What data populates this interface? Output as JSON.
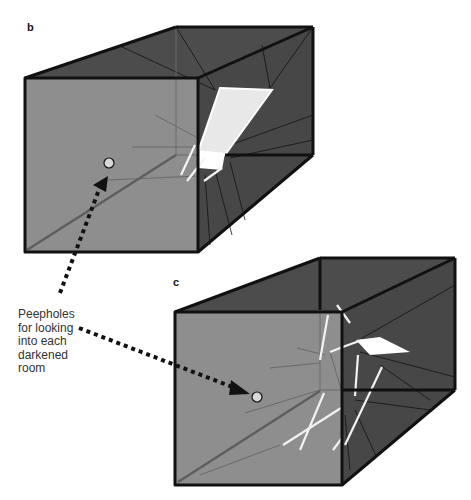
{
  "panels": {
    "b": {
      "label": "b"
    },
    "c": {
      "label": "c"
    }
  },
  "caption": {
    "lines": [
      "Peepholes",
      "for looking",
      "into each",
      "darkened",
      "room"
    ]
  },
  "colors": {
    "front_face": "#8a8a8a",
    "interior_dark": "#4a4a4a",
    "edge": "#111111",
    "highlight": "#ffffff",
    "peephole_fill": "#d8d8d8"
  }
}
